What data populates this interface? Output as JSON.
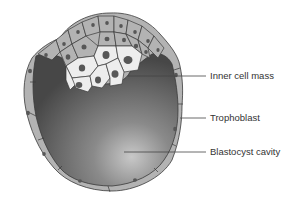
{
  "diagram": {
    "labels": [
      {
        "id": "inner-cell-mass",
        "text": "Inner cell mass"
      },
      {
        "id": "trophoblast",
        "text": "Trophoblast"
      },
      {
        "id": "blastocyst-cavity",
        "text": "Blastocyst cavity"
      }
    ],
    "colors": {
      "trophoblast_cell": "#b3b3b3",
      "inner_cell": "#ededed",
      "nucleus": "#575757",
      "cavity_dark": "#4a4a4a",
      "cavity_light": "#c4c4c4",
      "outline": "#3a3a3a",
      "leader_line": "#444444",
      "label_text": "#333333"
    }
  }
}
